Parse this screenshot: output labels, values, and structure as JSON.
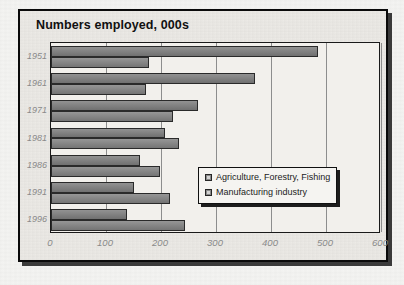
{
  "chart_data": {
    "type": "bar",
    "orientation": "horizontal",
    "title": "Numbers employed, 000s",
    "xlabel": "",
    "ylabel": "",
    "categories": [
      "1951",
      "1961",
      "1971",
      "1981",
      "1986",
      "1991",
      "1996"
    ],
    "series": [
      {
        "name": "Agriculture, Forestry, Fishing",
        "values": [
          485,
          370,
          268,
          208,
          162,
          150,
          138
        ],
        "color": "#7d7d7d"
      },
      {
        "name": "Manufacturing industry",
        "values": [
          178,
          173,
          222,
          232,
          198,
          217,
          244
        ],
        "color": "#828282"
      }
    ],
    "xticks": [
      "0",
      "100",
      "200",
      "300",
      "400",
      "500",
      "600"
    ],
    "xtick_values": [
      0,
      100,
      200,
      300,
      400,
      500,
      600
    ],
    "xlim": [
      0,
      600
    ],
    "grid": true,
    "grid_axis": "x",
    "legend_position": "middle-right",
    "legend": [
      "Agriculture, Forestry, Fishing",
      "Manufacturing industry"
    ]
  },
  "chart": {
    "title": "Numbers employed, 000s",
    "frame_color": "#0a0a0a",
    "plot_bg": "#f2f0ec",
    "gridline_color": "#8d8d8d",
    "tick_label_color": "#8a8a8a"
  },
  "legend": {
    "items": [
      {
        "label": "Agriculture, Forestry, Fishing",
        "swatch": "legend-swatch-icon"
      },
      {
        "label": "Manufacturing industry",
        "swatch": "legend-swatch-icon"
      }
    ]
  }
}
